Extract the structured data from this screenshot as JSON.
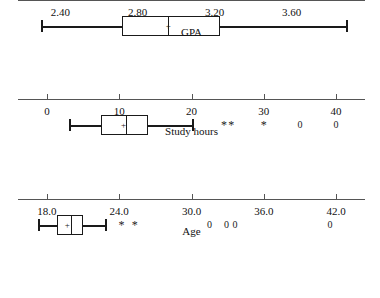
{
  "figure": {
    "type": "boxplot-panels",
    "panel_count": 3,
    "background": "#ffffff",
    "line_color": "#1a1a1a",
    "axis_color": "#555555"
  },
  "chart_data": [
    {
      "type": "boxplot",
      "title": "",
      "xlabel": "GPA",
      "ylabel": "",
      "orientation": "horizontal",
      "xlim": [
        2.18,
        3.98
      ],
      "ticks": [
        2.4,
        2.8,
        3.2,
        3.6
      ],
      "tick_labels": [
        "2.40",
        "2.80",
        "3.20",
        "3.60"
      ],
      "grid": false,
      "legend": "none",
      "stats": {
        "whisker_low": 2.3,
        "q1": 2.72,
        "median": 2.96,
        "mean": 2.96,
        "q3": 3.23,
        "whisker_high": 3.88
      },
      "outliers": []
    },
    {
      "type": "boxplot",
      "title": "",
      "xlabel": "Study hours",
      "ylabel": "",
      "orientation": "horizontal",
      "xlim": [
        -4.0,
        44.0
      ],
      "ticks": [
        0,
        10,
        20,
        30,
        40
      ],
      "tick_labels": [
        "0",
        "10",
        "20",
        "30",
        "40"
      ],
      "grid": false,
      "legend": "none",
      "stats": {
        "whisker_low": 3.0,
        "q1": 7.5,
        "median": 11.0,
        "mean": 10.6,
        "q3": 14.0,
        "whisker_high": 20.0
      },
      "outliers": [
        {
          "value": 24.5,
          "marker": "*"
        },
        {
          "value": 25.5,
          "marker": "*"
        },
        {
          "value": 30.0,
          "marker": "*"
        },
        {
          "value": 35.0,
          "marker": "0"
        },
        {
          "value": 40.0,
          "marker": "0"
        }
      ]
    },
    {
      "type": "boxplot",
      "title": "",
      "xlabel": "Age",
      "ylabel": "",
      "orientation": "horizontal",
      "xlim": [
        15.6,
        44.4
      ],
      "ticks": [
        18.0,
        24.0,
        30.0,
        36.0,
        42.0
      ],
      "tick_labels": [
        "18.0",
        "24.0",
        "30.0",
        "36.0",
        "42.0"
      ],
      "grid": false,
      "legend": "none",
      "stats": {
        "whisker_low": 17.3,
        "q1": 18.8,
        "median": 20.0,
        "mean": 19.7,
        "q3": 21.0,
        "whisker_high": 22.8
      },
      "outliers": [
        {
          "value": 24.2,
          "marker": "*"
        },
        {
          "value": 25.3,
          "marker": "*"
        },
        {
          "value": 31.5,
          "marker": "0"
        },
        {
          "value": 32.9,
          "marker": "0"
        },
        {
          "value": 33.6,
          "marker": "0"
        },
        {
          "value": 41.5,
          "marker": "0"
        }
      ]
    }
  ]
}
